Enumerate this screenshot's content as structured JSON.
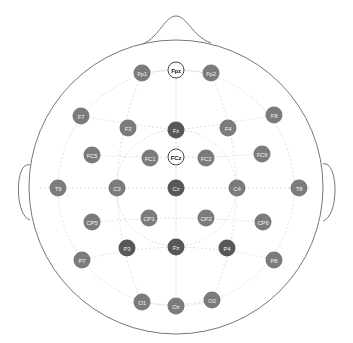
{
  "diagram": {
    "head": {
      "cx": 176,
      "cy": 187,
      "r": 147
    },
    "colors": {
      "normal": "#7b7b7b",
      "dark": "#585858",
      "reference_fill": "#ffffff",
      "outline": "#666666",
      "grid": "#d4d4d4"
    },
    "electrodes": [
      {
        "label": "Fp1",
        "x": 142,
        "y": 73,
        "type": "normal"
      },
      {
        "label": "Fpz",
        "x": 176,
        "y": 70,
        "type": "ref"
      },
      {
        "label": "Fp2",
        "x": 211,
        "y": 73,
        "type": "normal"
      },
      {
        "label": "F7",
        "x": 81,
        "y": 116,
        "type": "normal"
      },
      {
        "label": "F3",
        "x": 128,
        "y": 128,
        "type": "normal"
      },
      {
        "label": "Fz",
        "x": 176,
        "y": 130,
        "type": "dark"
      },
      {
        "label": "F4",
        "x": 228,
        "y": 128,
        "type": "normal"
      },
      {
        "label": "F8",
        "x": 274,
        "y": 115,
        "type": "normal"
      },
      {
        "label": "FC5",
        "x": 92,
        "y": 155,
        "type": "normal"
      },
      {
        "label": "FC1",
        "x": 150,
        "y": 158,
        "type": "normal"
      },
      {
        "label": "FCz",
        "x": 176,
        "y": 157,
        "type": "ref"
      },
      {
        "label": "FC2",
        "x": 206,
        "y": 158,
        "type": "normal"
      },
      {
        "label": "FC6",
        "x": 262,
        "y": 154,
        "type": "normal"
      },
      {
        "label": "T9",
        "x": 58,
        "y": 188,
        "type": "normal"
      },
      {
        "label": "C3",
        "x": 117,
        "y": 188,
        "type": "normal"
      },
      {
        "label": "Cz",
        "x": 176,
        "y": 188,
        "type": "dark"
      },
      {
        "label": "C4",
        "x": 237,
        "y": 188,
        "type": "normal"
      },
      {
        "label": "T8",
        "x": 299,
        "y": 188,
        "type": "normal"
      },
      {
        "label": "CP5",
        "x": 92,
        "y": 222,
        "type": "normal"
      },
      {
        "label": "CP1",
        "x": 149,
        "y": 218,
        "type": "normal"
      },
      {
        "label": "CP2",
        "x": 206,
        "y": 218,
        "type": "normal"
      },
      {
        "label": "CP6",
        "x": 263,
        "y": 222,
        "type": "normal"
      },
      {
        "label": "P7",
        "x": 82,
        "y": 260,
        "type": "normal"
      },
      {
        "label": "P3",
        "x": 127,
        "y": 248,
        "type": "dark"
      },
      {
        "label": "Pz",
        "x": 176,
        "y": 247,
        "type": "dark"
      },
      {
        "label": "P4",
        "x": 227,
        "y": 248,
        "type": "dark"
      },
      {
        "label": "P8",
        "x": 274,
        "y": 260,
        "type": "normal"
      },
      {
        "label": "O1",
        "x": 142,
        "y": 302,
        "type": "normal"
      },
      {
        "label": "Oz",
        "x": 176,
        "y": 306,
        "type": "normal"
      },
      {
        "label": "O2",
        "x": 212,
        "y": 300,
        "type": "normal"
      }
    ]
  }
}
